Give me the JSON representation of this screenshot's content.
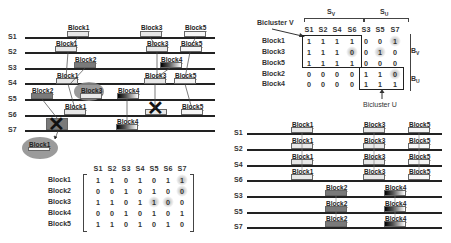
{
  "left_timeline": {
    "rows": [
      "S1",
      "S2",
      "S3",
      "S4",
      "S5",
      "S6",
      "S7"
    ],
    "blocks": [
      {
        "row": "S1",
        "label": "Block1",
        "style": "light"
      },
      {
        "row": "S1",
        "label": "Block3",
        "style": "light"
      },
      {
        "row": "S1",
        "label": "Block5",
        "style": "white"
      },
      {
        "row": "S2",
        "label": "Block1",
        "style": "light"
      },
      {
        "row": "S2",
        "label": "Block3",
        "style": "light"
      },
      {
        "row": "S2",
        "label": "Block5",
        "style": "white"
      },
      {
        "row": "S3",
        "label": "Block2",
        "style": "dark"
      },
      {
        "row": "S3",
        "label": "Block4",
        "style": "gradient"
      },
      {
        "row": "S4",
        "label": "Block1",
        "style": "light"
      },
      {
        "row": "S4",
        "label": "Block3",
        "style": "light"
      },
      {
        "row": "S4",
        "label": "Block5",
        "style": "white"
      },
      {
        "row": "S5",
        "label": "Block2",
        "style": "dark"
      },
      {
        "row": "S5",
        "label": "Block3",
        "style": "light",
        "highlighted": true
      },
      {
        "row": "S5",
        "label": "Block4",
        "style": "gradient"
      },
      {
        "row": "S6",
        "label": "Block1",
        "style": "light"
      },
      {
        "row": "S6",
        "label": "Block3",
        "style": "light",
        "crossed": true
      },
      {
        "row": "S6",
        "label": "Block5",
        "style": "white"
      },
      {
        "row": "S7",
        "label": "Block2",
        "style": "dark",
        "crossed": true
      },
      {
        "row": "S7",
        "label": "Block4",
        "style": "gradient"
      }
    ],
    "inserted_block": {
      "label": "Block1",
      "target_row": "S7"
    }
  },
  "left_matrix": {
    "columns": [
      "S1",
      "S2",
      "S3",
      "S4",
      "S5",
      "S6",
      "S7"
    ],
    "rows": [
      {
        "label": "Block1",
        "values": [
          "1",
          "1",
          "0",
          "1",
          "0",
          "1",
          "1"
        ]
      },
      {
        "label": "Block2",
        "values": [
          "0",
          "0",
          "1",
          "0",
          "1",
          "0",
          "0"
        ]
      },
      {
        "label": "Block3",
        "values": [
          "1",
          "1",
          "0",
          "1",
          "1",
          "0",
          "0"
        ]
      },
      {
        "label": "Block4",
        "values": [
          "0",
          "0",
          "1",
          "0",
          "1",
          "0",
          "1"
        ]
      },
      {
        "label": "Block5",
        "values": [
          "1",
          "1",
          "0",
          "1",
          "0",
          "1",
          "0"
        ]
      }
    ],
    "highlighted_cells": [
      [
        0,
        6
      ],
      [
        1,
        6
      ],
      [
        2,
        4
      ],
      [
        2,
        5
      ]
    ]
  },
  "right_matrix": {
    "group_v_label": "S",
    "group_v_sub": "V",
    "group_u_label": "S",
    "group_u_sub": "U",
    "bicluster_v_label": "Bicluster V",
    "bicluster_u_label": "Bicluster U",
    "bv_label": "B",
    "bv_sub": "V",
    "bu_label": "B",
    "bu_sub": "U",
    "columns": [
      "S1",
      "S2",
      "S4",
      "S6",
      "S3",
      "S5",
      "S7"
    ],
    "rows": [
      {
        "label": "Block1",
        "values": [
          "1",
          "1",
          "1",
          "1",
          "0",
          "0",
          "1"
        ]
      },
      {
        "label": "Block3",
        "values": [
          "1",
          "1",
          "1",
          "0",
          "0",
          "1",
          "0"
        ]
      },
      {
        "label": "Block5",
        "values": [
          "1",
          "1",
          "1",
          "1",
          "0",
          "0",
          "0"
        ]
      },
      {
        "label": "Block2",
        "values": [
          "0",
          "0",
          "0",
          "0",
          "1",
          "1",
          "0"
        ]
      },
      {
        "label": "Block4",
        "values": [
          "0",
          "0",
          "0",
          "0",
          "1",
          "1",
          "1"
        ]
      }
    ],
    "highlighted_cells": [
      [
        0,
        6
      ],
      [
        1,
        3
      ],
      [
        1,
        5
      ],
      [
        3,
        6
      ]
    ]
  },
  "right_timeline": {
    "rows": [
      "S1",
      "S2",
      "S4",
      "S6",
      "S3",
      "S5",
      "S7"
    ],
    "group_v_blocks": [
      {
        "label": "Block1",
        "style": "light"
      },
      {
        "label": "Block3",
        "style": "light"
      },
      {
        "label": "Block5",
        "style": "white"
      }
    ],
    "group_u_blocks": [
      {
        "label": "Block2",
        "style": "dark"
      },
      {
        "label": "Block4",
        "style": "gradient"
      }
    ]
  }
}
